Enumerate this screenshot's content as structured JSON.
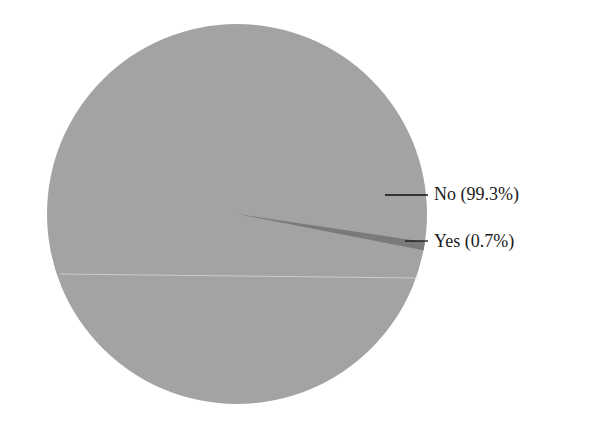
{
  "chart_data": {
    "type": "pie",
    "title": "",
    "categories": [
      "No",
      "Yes"
    ],
    "values": [
      99.3,
      0.7
    ],
    "unit": "%",
    "labels": [
      "No (99.3%)",
      "Yes (0.7%)"
    ],
    "colors": [
      "#a3a3a3",
      "#7a7a7a"
    ],
    "legend": "none (leader-line labels on right)",
    "geometry": {
      "cx": 237,
      "cy": 214,
      "r": 190,
      "small_slice_start_deg": 8.5,
      "small_slice_end_deg": 11.0
    },
    "leader_lines": [
      {
        "for": "No",
        "x1": 385,
        "y1": 195,
        "x2": 428,
        "y2": 195
      },
      {
        "for": "Yes",
        "x1": 405,
        "y1": 241,
        "x2": 428,
        "y2": 241
      }
    ]
  },
  "labels": {
    "no": "No (99.3%)",
    "yes": "Yes (0.7%)"
  }
}
